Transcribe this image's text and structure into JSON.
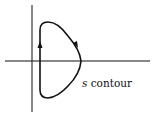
{
  "diagram": {
    "type": "complex-plane contour",
    "label_var": "s",
    "label_text": "contour",
    "colors": {
      "stroke": "#111111",
      "background": "#ffffff"
    },
    "arrows": [
      "upward on left vertical segment",
      "clockwise on upper-right arc"
    ]
  }
}
